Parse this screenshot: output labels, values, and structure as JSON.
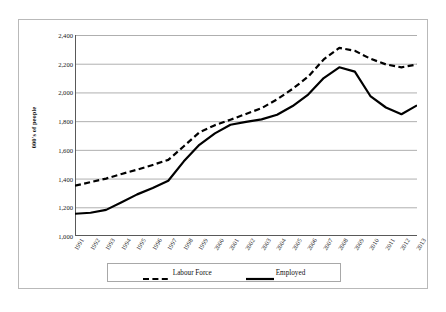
{
  "figure": {
    "caption": ""
  },
  "axes": {
    "y_title": "000's of people",
    "y_ticks": [
      "1,000",
      "1,200",
      "1,400",
      "1,600",
      "1,800",
      "2,000",
      "2,200",
      "2,400"
    ],
    "x_ticks": [
      "1991",
      "1992",
      "1993",
      "1994",
      "1995",
      "1996",
      "1997",
      "1998",
      "1999",
      "2000",
      "2001",
      "2002",
      "2003",
      "2004",
      "2005",
      "2006",
      "2007",
      "2008",
      "2009",
      "2010",
      "2011",
      "2012",
      "2013"
    ]
  },
  "legend": {
    "position": "bottom",
    "entries": [
      {
        "label": "Labour Force",
        "style": "dashed",
        "color": "#000000"
      },
      {
        "label": "Employed",
        "style": "solid",
        "color": "#000000"
      }
    ]
  },
  "colors": {
    "line": "#000000",
    "gridline": "#a6a6a6",
    "axis": "#595959",
    "frame": "#b9b9b9",
    "background": "#ffffff"
  },
  "chart_data": {
    "type": "line",
    "title": "",
    "xlabel": "",
    "ylabel": "000's of people",
    "ylim": [
      1000,
      2400
    ],
    "ytick_step": 200,
    "grid": true,
    "legend_position": "bottom",
    "x": [
      1991,
      1992,
      1993,
      1994,
      1995,
      1996,
      1997,
      1998,
      1999,
      2000,
      2001,
      2002,
      2003,
      2004,
      2005,
      2006,
      2007,
      2008,
      2009,
      2010,
      2011,
      2012,
      2013
    ],
    "series": [
      {
        "name": "Labour Force",
        "style": "dashed",
        "values": [
          1350,
          1375,
          1400,
          1432,
          1462,
          1495,
          1530,
          1625,
          1722,
          1772,
          1810,
          1850,
          1890,
          1952,
          2025,
          2110,
          2230,
          2310,
          2290,
          2235,
          2195,
          2175,
          2195
        ]
      },
      {
        "name": "Employed",
        "style": "solid",
        "values": [
          1155,
          1162,
          1182,
          1235,
          1290,
          1335,
          1385,
          1520,
          1635,
          1715,
          1775,
          1795,
          1812,
          1845,
          1905,
          1985,
          2100,
          2175,
          2145,
          1975,
          1895,
          1848,
          1910
        ]
      }
    ]
  }
}
